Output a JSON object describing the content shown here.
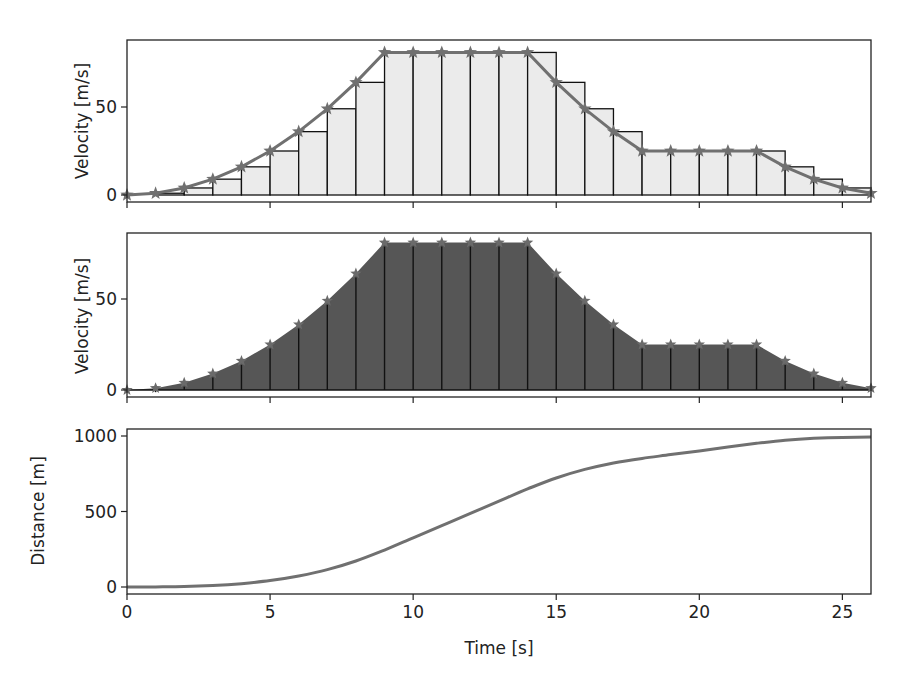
{
  "chart_data": [
    {
      "type": "bar",
      "subtype": "left-riemann-bars-with-line",
      "panel": "top",
      "title": "",
      "xlabel": "",
      "ylabel": "Velocity [m/s]",
      "x": [
        0,
        1,
        2,
        3,
        4,
        5,
        6,
        7,
        8,
        9,
        10,
        11,
        12,
        13,
        14,
        15,
        16,
        17,
        18,
        19,
        20,
        21,
        22,
        23,
        24,
        25,
        26
      ],
      "values": [
        0,
        1,
        4,
        9,
        16,
        25,
        36,
        49,
        64,
        81,
        81,
        81,
        81,
        81,
        81,
        64,
        49,
        36,
        25,
        25,
        25,
        25,
        25,
        16,
        9,
        4,
        1
      ],
      "marker": "star",
      "xlim": [
        0,
        26
      ],
      "ylim": [
        -4,
        88
      ],
      "yticks": [
        0,
        50
      ],
      "bar_fill": "#ebebeb",
      "line_color": "#707070"
    },
    {
      "type": "area",
      "subtype": "filled-area-with-stems",
      "panel": "middle",
      "title": "",
      "xlabel": "",
      "ylabel": "Velocity [m/s]",
      "x": [
        0,
        1,
        2,
        3,
        4,
        5,
        6,
        7,
        8,
        9,
        10,
        11,
        12,
        13,
        14,
        15,
        16,
        17,
        18,
        19,
        20,
        21,
        22,
        23,
        24,
        25,
        26
      ],
      "values": [
        0,
        1,
        4,
        9,
        16,
        25,
        36,
        49,
        64,
        81,
        81,
        81,
        81,
        81,
        81,
        64,
        49,
        36,
        25,
        25,
        25,
        25,
        25,
        16,
        9,
        4,
        1
      ],
      "marker": "star",
      "xlim": [
        0,
        26
      ],
      "ylim": [
        -4,
        88
      ],
      "yticks": [
        0,
        50
      ],
      "fill": "#565656"
    },
    {
      "type": "line",
      "panel": "bottom",
      "title": "",
      "xlabel": "Time [s]",
      "ylabel": "Distance [m]",
      "x": [
        0,
        1,
        2,
        3,
        4,
        5,
        6,
        7,
        8,
        9,
        10,
        11,
        12,
        13,
        14,
        15,
        16,
        17,
        18,
        19,
        20,
        21,
        22,
        23,
        24,
        25,
        26
      ],
      "values": [
        0,
        0.5,
        3,
        9.5,
        22,
        42.5,
        73,
        115.5,
        172,
        244.5,
        325.5,
        406.5,
        487.5,
        568.5,
        649.5,
        722,
        778.5,
        821,
        851.5,
        876.5,
        901.5,
        926.5,
        951.5,
        972,
        984.5,
        991,
        993.5
      ],
      "xlim": [
        0,
        26
      ],
      "ylim": [
        -50,
        1045
      ],
      "xticks": [
        0,
        5,
        10,
        15,
        20,
        25
      ],
      "yticks": [
        0,
        500,
        1000
      ],
      "line_color": "#707070"
    }
  ],
  "labels": {
    "top_ylabel": "Velocity [m/s]",
    "mid_ylabel": "Velocity [m/s]",
    "bot_ylabel": "Distance [m]",
    "xlabel": "Time [s]",
    "vel_ticks": [
      "0",
      "50"
    ],
    "dist_ticks": [
      "0",
      "500",
      "1000"
    ],
    "x_ticks": [
      "0",
      "5",
      "10",
      "15",
      "20",
      "25"
    ]
  }
}
